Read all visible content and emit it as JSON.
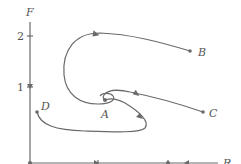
{
  "diagram": {
    "type": "phase-plane",
    "x_axis": {
      "label": "R",
      "ticks": [
        "1",
        "2"
      ]
    },
    "y_axis": {
      "label": "F",
      "ticks": [
        "1",
        "2"
      ]
    },
    "points": [
      {
        "id": "A",
        "label": "A"
      },
      {
        "id": "B",
        "label": "B"
      },
      {
        "id": "C",
        "label": "C"
      },
      {
        "id": "D",
        "label": "D"
      }
    ],
    "colors": {
      "stroke": "#6a6a6a",
      "text": "#555555",
      "background": "#ffffff"
    }
  }
}
